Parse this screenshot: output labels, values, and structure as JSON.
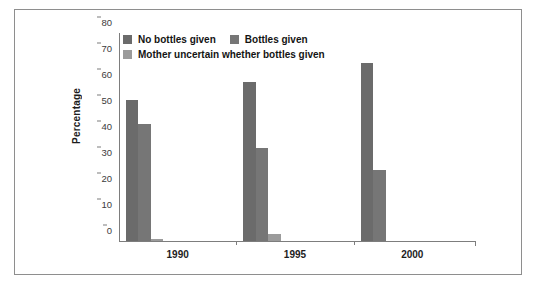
{
  "chart_data": {
    "type": "bar",
    "title": "",
    "xlabel": "",
    "ylabel": "Percentage",
    "categories": [
      "1990",
      "1995",
      "2000"
    ],
    "ylim": [
      0,
      80
    ],
    "yticks": [
      "0",
      "10",
      "20",
      "30",
      "40",
      "50",
      "60",
      "70",
      "80"
    ],
    "grid": false,
    "legend_position": "top-left inside",
    "series": [
      {
        "name": "No bottles given",
        "color": "#6b6b6b",
        "values": [
          54.2,
          61.0,
          68.6
        ]
      },
      {
        "name": "Bottles given",
        "color": "#767676",
        "values": [
          45.0,
          35.6,
          27.5
        ]
      },
      {
        "name": "Mother uncertain whether bottles given",
        "color": "#9b9b9b",
        "values": [
          0.8,
          2.8,
          0
        ]
      }
    ]
  },
  "style": {
    "frame_border": "#8e8e8e",
    "axis_color": "#7d7d7d",
    "tick_text_color": "#3b3b3b",
    "label_color": "#1d1d1d",
    "background": "#ffffff"
  }
}
